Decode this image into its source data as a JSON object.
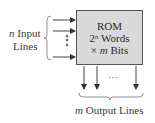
{
  "diagram": {
    "block": {
      "title": "ROM",
      "line2_prefix": "2",
      "line2_exp": "n",
      "line2_suffix": " Words",
      "line3_prefix": "× ",
      "line3_var": "m",
      "line3_suffix": " Bits",
      "fill_color": "#d9d9d9",
      "border_color": "#555555"
    },
    "inputs": {
      "label_var": "n",
      "label_line1": " Input",
      "label_line2": "Lines",
      "ellipsis": "⋮",
      "arrow_count_shown": 3
    },
    "outputs": {
      "label_var": "m",
      "label_text": " Output Lines",
      "ellipsis": "···",
      "arrow_count_shown": 3
    }
  }
}
